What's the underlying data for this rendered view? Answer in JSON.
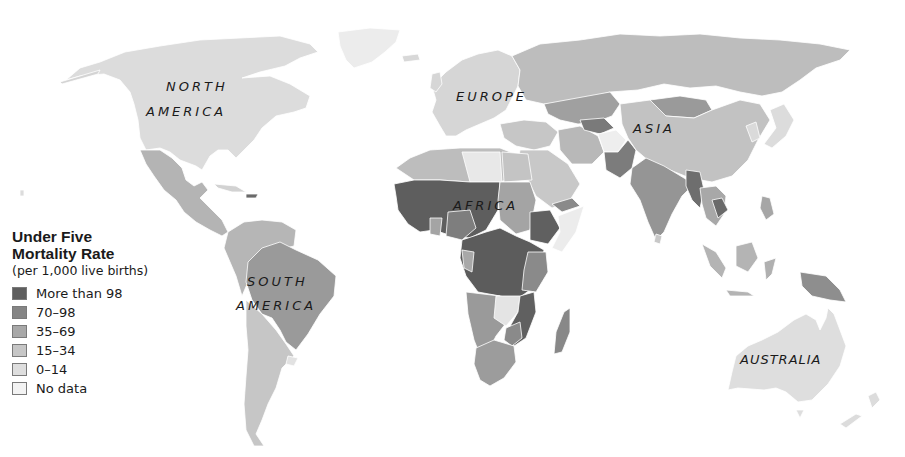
{
  "map": {
    "type": "choropleth",
    "subject": "Under Five Mortality Rate by country"
  },
  "labels": {
    "north_america_1": "NORTH",
    "north_america_2": "AMERICA",
    "south_america_1": "SOUTH",
    "south_america_2": "AMERICA",
    "europe": "EUROPE",
    "asia": "ASIA",
    "africa": "AFRICA",
    "australia": "AUSTRALIA"
  },
  "legend": {
    "title_line1": "Under Five",
    "title_line2": "Mortality Rate",
    "subtitle": "(per 1,000 live births)",
    "items": [
      {
        "label": "More than 98",
        "color": "#5e5e5e"
      },
      {
        "label": "70–98",
        "color": "#858585"
      },
      {
        "label": "35–69",
        "color": "#a8a8a8"
      },
      {
        "label": "15–34",
        "color": "#c6c6c6"
      },
      {
        "label": "0–14",
        "color": "#dedede"
      },
      {
        "label": "No data",
        "color": "#f3f3f3"
      }
    ]
  }
}
